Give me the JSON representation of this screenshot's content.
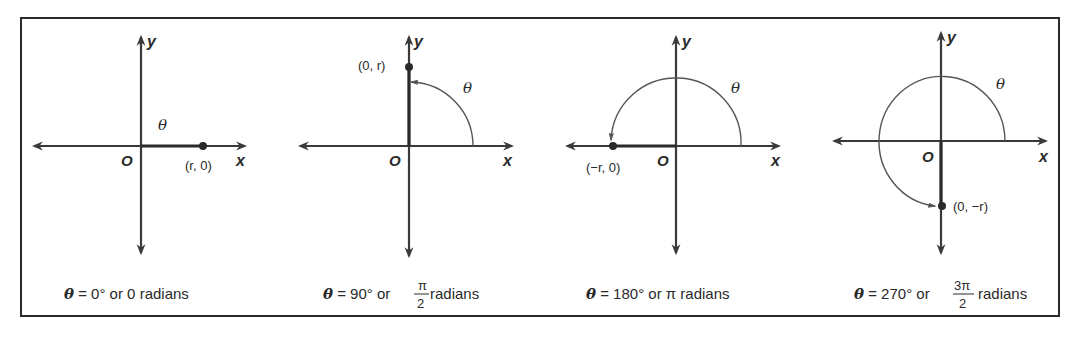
{
  "figure": {
    "panels": [
      {
        "id": "0deg",
        "point_label": "(r, 0)",
        "angle_label": "θ",
        "caption": {
          "symbol": "θ",
          "eq": " = 0° or 0 radians"
        }
      },
      {
        "id": "90deg",
        "point_label": "(0, r)",
        "angle_label": "θ",
        "caption": {
          "symbol": "θ",
          "eq": " = 90° or ",
          "frac_num": "π",
          "frac_den": "2",
          "tail": " radians"
        }
      },
      {
        "id": "180deg",
        "point_label": "(−r, 0)",
        "angle_label": "θ",
        "caption": {
          "symbol": "θ",
          "eq": " = 180° or π radians"
        }
      },
      {
        "id": "270deg",
        "point_label": "(0, −r)",
        "angle_label": "θ",
        "caption": {
          "symbol": "θ",
          "eq": " = 270° or ",
          "frac_num": "3π",
          "frac_den": "2",
          "tail": " radians"
        }
      }
    ],
    "axis_labels": {
      "x": "x",
      "y": "y",
      "origin": "O"
    }
  }
}
